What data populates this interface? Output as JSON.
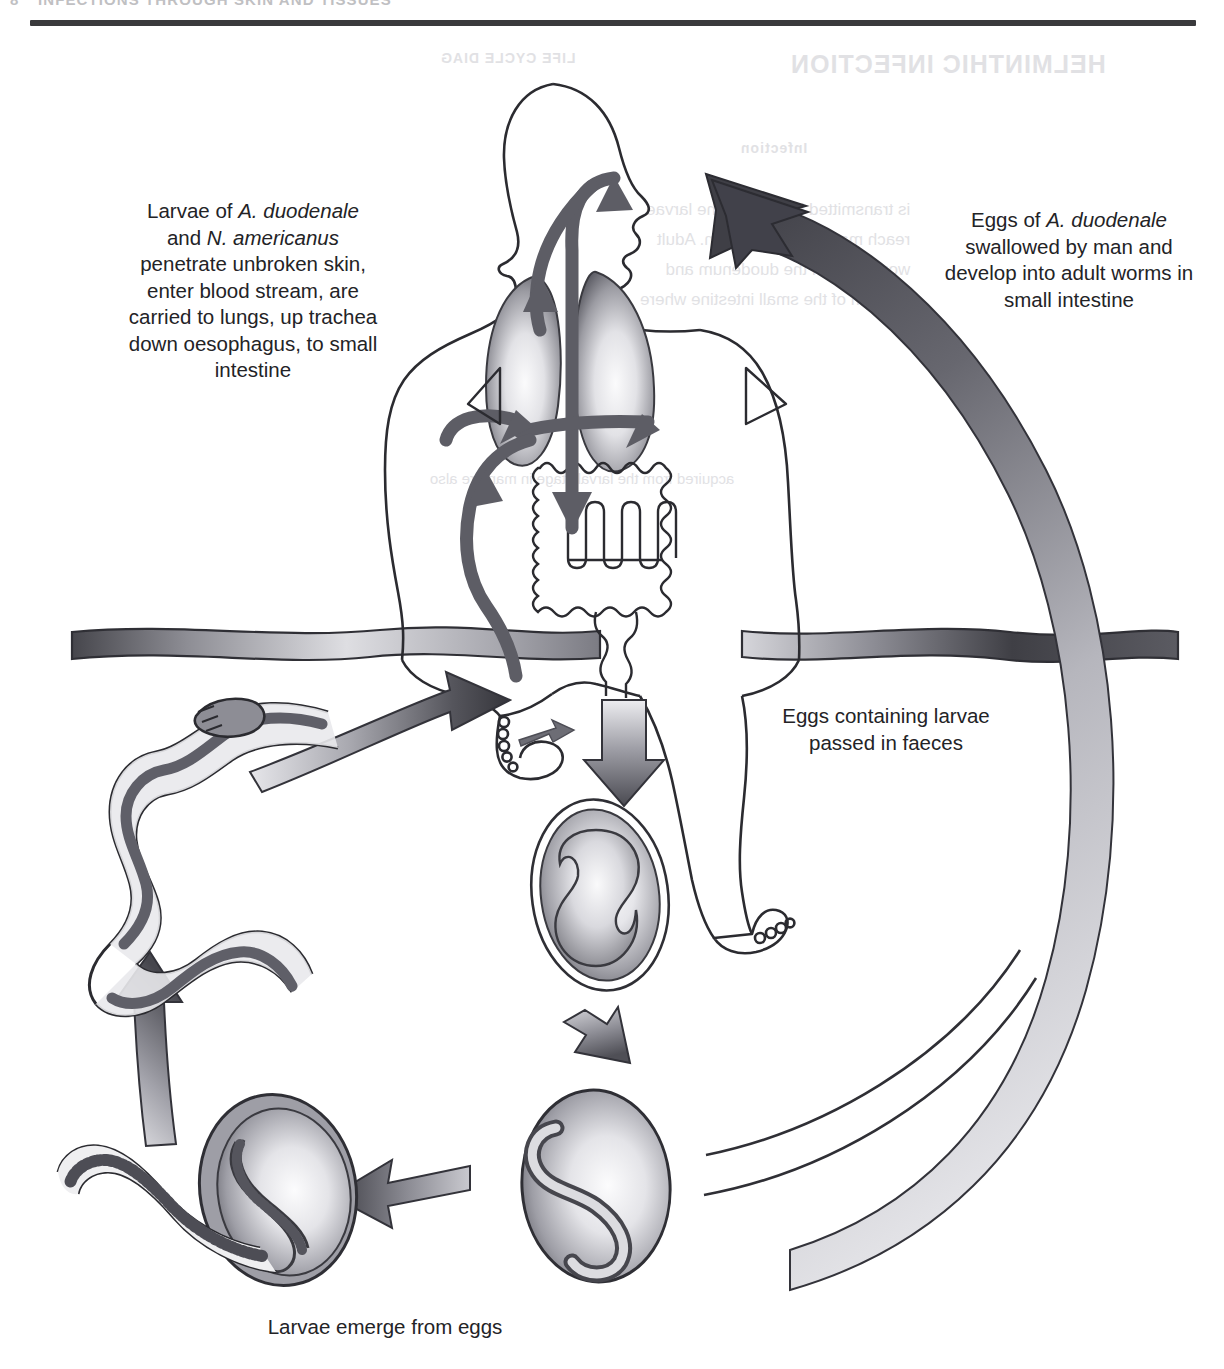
{
  "page": {
    "folio": "8",
    "running_head": "INFECTIONS THROUGH SKIN AND TISSUES",
    "ghost_heading": "HELMINTHIC INFECTION",
    "ghost_sub": "Infection",
    "ghost_col": "LIFE CYCLE DIAG",
    "ghost_body": "is transmitted by larvae. The larvae\nreach man through the skin. Adult\nworms live in the duodenum and\njejunum of the small intestine where",
    "ghost_line": "acquired from the larval stage in man are also"
  },
  "captions": {
    "left": {
      "line1_pre": "Larvae of ",
      "line1_it": "A. duodenale",
      "line2_pre": "and ",
      "line2_it": "N. americanus",
      "rest": "penetrate unbroken skin, enter blood stream, are carried to lungs, up trachea down oesophagus, to small intestine"
    },
    "right": {
      "line1_pre": "Eggs of ",
      "line1_it": "A. duodenale",
      "rest": "swallowed by man and develop into adult worms in small intestine"
    },
    "faeces": "Eggs containing larvae passed in faeces",
    "bottom": "Larvae emerge from eggs"
  },
  "diagram": {
    "type": "life-cycle",
    "stages": [
      {
        "id": "human",
        "label": "human host"
      },
      {
        "id": "lungs",
        "label": "lungs"
      },
      {
        "id": "trachea",
        "label": "trachea"
      },
      {
        "id": "small-intestine",
        "label": "small intestine"
      },
      {
        "id": "egg-2cell",
        "label": "egg with developing embryo"
      },
      {
        "id": "egg-larvated",
        "label": "egg containing larva"
      },
      {
        "id": "egg-hatching",
        "label": "larva emerging from egg"
      },
      {
        "id": "adult-worm",
        "label": "adult hookworm"
      }
    ],
    "soil_line_label": "soil surface"
  },
  "colors": {
    "ink": "#2b2b2b",
    "rule": "#3a3a3c",
    "arrow_dark": "#4a4a4f",
    "arrow_mid": "#8a8a90",
    "arrow_light": "#d6d6da",
    "organ_dark": "#6e6e75",
    "organ_light": "#f4f4f6",
    "ghost": "#d8d8dc"
  }
}
